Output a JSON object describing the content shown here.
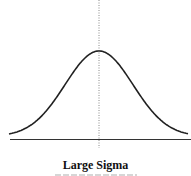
{
  "figure": {
    "caption": "Large Sigma",
    "subcaption_visible": false,
    "colors": {
      "curve": "#222222",
      "axis": "#333333",
      "mean_line": "#888888"
    },
    "curve": {
      "type": "gaussian",
      "peak": [
        99,
        51
      ],
      "baseline_y": 134,
      "x_range": [
        9,
        188
      ],
      "sigma_px": 34
    },
    "axis": {
      "y": 139,
      "x_start": 10,
      "x_end": 191
    },
    "mean_line": {
      "x": 99,
      "y_start": 0,
      "y_end": 148,
      "style": "dotted"
    }
  }
}
